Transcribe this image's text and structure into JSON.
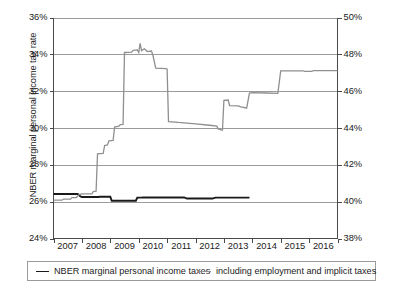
{
  "chart_data": {
    "type": "line",
    "title": "",
    "xlabel": "",
    "ylabel": "NBER marginal personal income tax rate",
    "ylabel_right": "Incl. employment & implicit taxes",
    "xlim": [
      2007,
      2017
    ],
    "ylim": [
      24,
      36
    ],
    "ylim_right": [
      38,
      50
    ],
    "grid": true,
    "legend_position": "below-plot",
    "yticks": [
      "24%",
      "26%",
      "28%",
      "30%",
      "32%",
      "34%",
      "36%"
    ],
    "ytick_values": [
      24,
      26,
      28,
      30,
      32,
      34,
      36
    ],
    "yticks_right": [
      "38%",
      "40%",
      "42%",
      "44%",
      "46%",
      "48%",
      "50%"
    ],
    "ytick_values_right": [
      38,
      40,
      42,
      44,
      46,
      48,
      50
    ],
    "xticks": [
      "2007",
      "2008",
      "2009",
      "2010",
      "2011",
      "2012",
      "2013",
      "2014",
      "2015",
      "2016"
    ],
    "xtick_values": [
      2007,
      2008,
      2009,
      2010,
      2011,
      2012,
      2013,
      2014,
      2015,
      2016
    ],
    "series": [
      {
        "name": "NBER marginal personal income taxes",
        "color": "#1a1a1a",
        "axis": "left",
        "width": 1.9,
        "points": [
          [
            2007.0,
            26.42
          ],
          [
            2007.85,
            26.42
          ],
          [
            2007.95,
            26.28
          ],
          [
            2008.0,
            26.25
          ],
          [
            2008.6,
            26.25
          ],
          [
            2008.62,
            26.27
          ],
          [
            2009.0,
            26.27
          ],
          [
            2009.05,
            26.05
          ],
          [
            2009.9,
            26.05
          ],
          [
            2009.95,
            26.22
          ],
          [
            2010.1,
            26.22
          ],
          [
            2010.15,
            26.23
          ],
          [
            2011.6,
            26.23
          ],
          [
            2011.7,
            26.17
          ],
          [
            2012.6,
            26.17
          ],
          [
            2012.7,
            26.22
          ],
          [
            2013.9,
            26.22
          ]
        ]
      },
      {
        "name": "including employment and implicit taxes",
        "color": "#8f8f8f",
        "axis": "left",
        "width": 1.3,
        "points": [
          [
            2007.0,
            26.08
          ],
          [
            2007.3,
            26.08
          ],
          [
            2007.35,
            26.14
          ],
          [
            2007.6,
            26.14
          ],
          [
            2007.65,
            26.22
          ],
          [
            2007.8,
            26.22
          ],
          [
            2007.9,
            26.38
          ],
          [
            2008.0,
            26.42
          ],
          [
            2008.35,
            26.42
          ],
          [
            2008.4,
            26.55
          ],
          [
            2008.5,
            26.57
          ],
          [
            2008.55,
            28.6
          ],
          [
            2008.75,
            28.62
          ],
          [
            2008.8,
            29.05
          ],
          [
            2008.9,
            29.08
          ],
          [
            2008.95,
            29.3
          ],
          [
            2009.1,
            29.33
          ],
          [
            2009.15,
            30.05
          ],
          [
            2009.3,
            30.1
          ],
          [
            2009.35,
            30.18
          ],
          [
            2009.45,
            30.2
          ],
          [
            2009.5,
            34.1
          ],
          [
            2009.75,
            34.12
          ],
          [
            2009.8,
            34.22
          ],
          [
            2009.95,
            34.24
          ],
          [
            2010.0,
            34.1
          ],
          [
            2010.05,
            34.6
          ],
          [
            2010.1,
            34.2
          ],
          [
            2010.2,
            34.3
          ],
          [
            2010.3,
            34.15
          ],
          [
            2010.45,
            34.18
          ],
          [
            2010.5,
            33.95
          ],
          [
            2010.6,
            33.25
          ],
          [
            2010.95,
            33.22
          ],
          [
            2011.0,
            33.2
          ],
          [
            2011.05,
            30.35
          ],
          [
            2011.4,
            30.3
          ],
          [
            2011.6,
            30.28
          ],
          [
            2012.0,
            30.22
          ],
          [
            2012.5,
            30.15
          ],
          [
            2012.75,
            30.1
          ],
          [
            2012.8,
            29.95
          ],
          [
            2012.9,
            29.9
          ],
          [
            2012.95,
            29.88
          ],
          [
            2013.0,
            31.5
          ],
          [
            2013.15,
            31.52
          ],
          [
            2013.2,
            31.22
          ],
          [
            2013.5,
            31.2
          ],
          [
            2013.6,
            31.15
          ],
          [
            2013.75,
            31.1
          ],
          [
            2013.8,
            31.08
          ],
          [
            2013.9,
            31.9
          ],
          [
            2014.0,
            31.92
          ],
          [
            2014.5,
            31.9
          ],
          [
            2014.9,
            31.88
          ],
          [
            2015.0,
            33.1
          ],
          [
            2015.8,
            33.1
          ],
          [
            2015.85,
            33.08
          ],
          [
            2016.1,
            33.08
          ],
          [
            2016.15,
            33.12
          ],
          [
            2017.0,
            33.12
          ]
        ]
      }
    ]
  },
  "legend": {
    "entries": [
      {
        "label": "NBER marginal personal income taxes",
        "swatch": "black"
      },
      {
        "label": "including employment and implicit taxes",
        "swatch": "gray"
      }
    ]
  },
  "colors": {
    "series_black": "#1a1a1a",
    "series_gray": "#8f8f8f",
    "grid": "#9b9b9b",
    "axis": "#4a4a4a",
    "background": "#ffffff"
  }
}
